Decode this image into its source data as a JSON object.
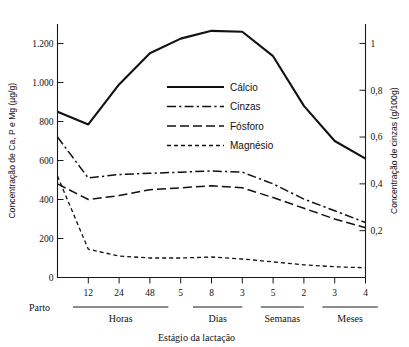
{
  "chart_data": {
    "type": "line",
    "title": "",
    "xlabel": "Estágio da lactação",
    "ylabel": "Concentração de Ca, P e Mg (µg/g)",
    "y2label": "Concentração de cinzas (g/100g)",
    "ylim": [
      0,
      1300
    ],
    "y2lim": [
      0,
      1.083
    ],
    "grid": false,
    "legend_position": "upper-center-inside",
    "x_tick_labels": [
      "12",
      "24",
      "48",
      "5",
      "8",
      "3",
      "5",
      "2",
      "3",
      "4"
    ],
    "x_categories": [
      "Parto",
      "12 h",
      "24 h",
      "48 h",
      "5 d",
      "8 d",
      "3 sem",
      "5 sem",
      "2 m",
      "3 m",
      "4 m"
    ],
    "y_tick_labels": [
      "0",
      "200",
      "400",
      "600",
      "800",
      "1.000",
      "1.200"
    ],
    "y_tick_values": [
      0,
      200,
      400,
      600,
      800,
      1000,
      1200
    ],
    "y2_tick_labels": [
      "0,2",
      "0,4",
      "0,6",
      "0,8",
      "1"
    ],
    "y2_tick_values": [
      0.2,
      0.4,
      0.6,
      0.8,
      1
    ],
    "x_groups": [
      {
        "label": "Parto",
        "rule": false
      },
      {
        "label": "Horas",
        "rule": true
      },
      {
        "label": "Dias",
        "rule": true
      },
      {
        "label": "Semanas",
        "rule": true
      },
      {
        "label": "Meses",
        "rule": true
      }
    ],
    "series": [
      {
        "name": "Cálcio",
        "dash": "solid",
        "axis": "left",
        "units": "µg/g",
        "values": [
          850,
          785,
          990,
          1150,
          1225,
          1265,
          1260,
          1135,
          880,
          700,
          610
        ]
      },
      {
        "name": "Cinzas",
        "dash": "dashdot",
        "axis": "right",
        "units": "g/100g",
        "values": [
          0.6,
          0.425,
          0.44,
          0.445,
          0.45,
          0.455,
          0.45,
          0.4,
          0.335,
          0.285,
          0.235
        ]
      },
      {
        "name": "Fósforo",
        "dash": "dashed",
        "axis": "left",
        "units": "µg/g",
        "values": [
          480,
          400,
          420,
          450,
          460,
          470,
          460,
          410,
          355,
          300,
          255
        ]
      },
      {
        "name": "Magnésio",
        "dash": "dotted",
        "axis": "left",
        "units": "µg/g",
        "values": [
          520,
          145,
          110,
          100,
          100,
          105,
          95,
          80,
          65,
          55,
          50
        ]
      }
    ]
  },
  "legend": {
    "items": [
      {
        "label": "Cálcio"
      },
      {
        "label": "Cinzas"
      },
      {
        "label": "Fósforo"
      },
      {
        "label": "Magnésio"
      }
    ]
  }
}
